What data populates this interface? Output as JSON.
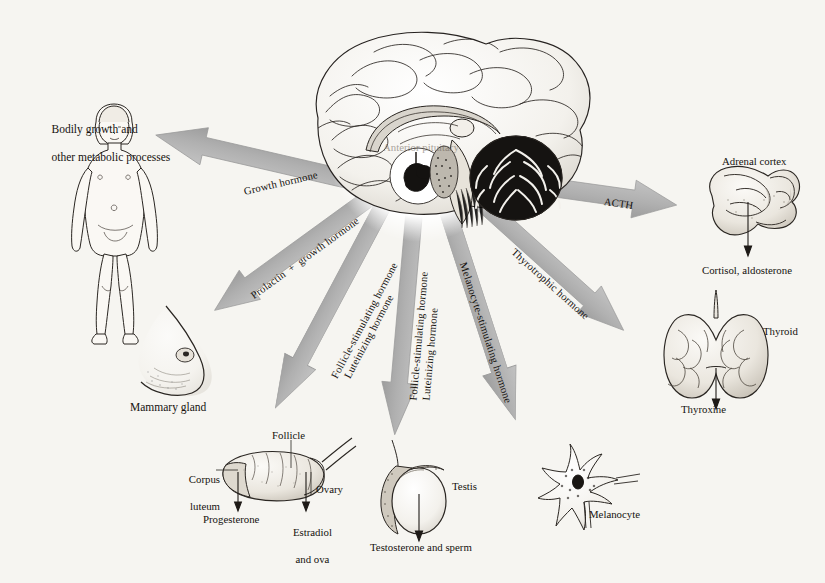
{
  "figure": {
    "center_label": "Anterior pituitary",
    "background_color": "#f6f5f1",
    "arrow_color": "#b3b3b3",
    "arrow_shadow_color": "#9a9a9a",
    "ink_color": "#1a1a1a"
  },
  "central_structure": {
    "name": "brain-midsagittal",
    "parts": [
      "cerebrum",
      "corpus callosum",
      "thalamus",
      "cerebellum",
      "brainstem",
      "pituitary gland"
    ]
  },
  "pathways": [
    {
      "id": "growth-hormone",
      "hormone": "Growth hormone",
      "hormone_lines": [
        "Growth hormone"
      ],
      "angle_deg": 193,
      "target_name": "child-figure",
      "target_label": "",
      "caption": "Bodily growth and\nother metabolic processes",
      "caption_lines": [
        "Bodily growth and",
        "other metabolic processes"
      ],
      "products": []
    },
    {
      "id": "prolactin-growth-hormone",
      "hormone": "Prolactin + growth hormone",
      "hormone_lines": [
        "Prolactin  +  growth hormone"
      ],
      "angle_deg": 144,
      "target_name": "mammary-gland",
      "target_label": "Mammary gland",
      "caption": "",
      "caption_lines": [],
      "products": []
    },
    {
      "id": "fsh-lh-ovary",
      "hormone": "Follicle-stimulating hormone / Luteinizing hormone",
      "hormone_lines": [
        "Follicle-stimulating hormone",
        "Luteinizing hormone"
      ],
      "angle_deg": 118,
      "target_name": "ovary",
      "target_label": "Ovary",
      "caption": "",
      "caption_lines": [],
      "products": [
        "Progesterone",
        "Estradiol and ova"
      ],
      "annotations": [
        "Follicle",
        "Corpus luteum",
        "Ovary"
      ]
    },
    {
      "id": "fsh-lh-testis",
      "hormone": "Follicle-stimulating hormone / Luteinizing hormone",
      "hormone_lines": [
        "Follicle-stimulating hormone",
        "Luteinizing hormone"
      ],
      "angle_deg": 95,
      "target_name": "testis",
      "target_label": "Testis",
      "caption": "",
      "caption_lines": [],
      "products": [
        "Testosterone and sperm"
      ]
    },
    {
      "id": "melanocyte-stimulating-hormone",
      "hormone": "Melanocyte-stimulating hormone",
      "hormone_lines": [
        "Melanocyte-stimulating hormone"
      ],
      "angle_deg": 72,
      "target_name": "melanocyte",
      "target_label": "Melanocyte",
      "caption": "",
      "caption_lines": [],
      "products": []
    },
    {
      "id": "thyrotrophic-hormone",
      "hormone": "Thyrotrophic hormone",
      "hormone_lines": [
        "Thyrotrophic hormone"
      ],
      "angle_deg": 42,
      "target_name": "thyroid",
      "target_label": "Thyroid",
      "caption": "",
      "caption_lines": [],
      "products": [
        "Thyroxine"
      ]
    },
    {
      "id": "acth",
      "hormone": "ACTH",
      "hormone_lines": [
        "ACTH"
      ],
      "angle_deg": 8,
      "target_name": "adrenal-cortex",
      "target_label": "Adrenal cortex",
      "caption": "",
      "caption_lines": [],
      "products": [
        "Cortisol, aldosterone"
      ]
    }
  ],
  "labels": {
    "bodily_growth_l1": "Bodily growth and",
    "bodily_growth_l2": "other metabolic processes",
    "mammary_gland": "Mammary gland",
    "follicle": "Follicle",
    "corpus_l1": "Corpus",
    "corpus_l2": "luteum",
    "ovary": "Ovary",
    "progesterone": "Progesterone",
    "estradiol_l1": "Estradiol",
    "estradiol_l2": "and ova",
    "testis": "Testis",
    "testosterone": "Testosterone and sperm",
    "melanocyte": "Melanocyte",
    "thyroid": "Thyroid",
    "thyroxine": "Thyroxine",
    "adrenal_cortex": "Adrenal cortex",
    "cortisol": "Cortisol, aldosterone",
    "anterior_pituitary": "Anterior pituitary"
  },
  "arrow_labels": {
    "growth_hormone": "Growth hormone",
    "prolactin_growth": "Prolactin  +  growth hormone",
    "fsh_left": "Follicle-stimulating hormone",
    "lh_left": "Luteinizing hormone",
    "fsh_mid": "Follicle-stimulating hormone",
    "lh_mid": "Luteinizing hormone",
    "msh": "Melanocyte-stimulating hormone",
    "thyrotrophic": "Thyrotrophic hormone",
    "acth": "ACTH"
  }
}
